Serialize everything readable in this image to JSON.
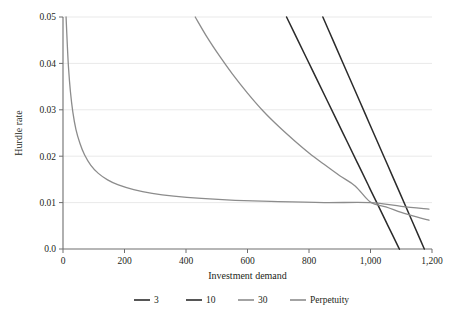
{
  "chart_data": {
    "type": "line",
    "title": "",
    "xlabel": "Investment demand",
    "ylabel": "Hurdle rate",
    "xlim": [
      0,
      1200
    ],
    "ylim": [
      0.0,
      0.05
    ],
    "grid": true,
    "grid_axis": "y",
    "legend_position": "bottom",
    "xticks": [
      0,
      200,
      400,
      600,
      800,
      1000,
      1200
    ],
    "xtick_labels": [
      "0",
      "200",
      "400",
      "600",
      "800",
      "1,000",
      "1,200"
    ],
    "yticks": [
      0.0,
      0.01,
      0.02,
      0.03,
      0.04,
      0.05
    ],
    "ytick_labels": [
      "0.0",
      "0.01",
      "0.02",
      "0.03",
      "0.04",
      "0.05"
    ],
    "series": [
      {
        "name": "3",
        "color": "#2b2b2b",
        "width": 1.5,
        "points": [
          [
            727,
            0.05
          ],
          [
            760,
            0.0455
          ],
          [
            793,
            0.041
          ],
          [
            826,
            0.0365
          ],
          [
            859,
            0.032
          ],
          [
            892,
            0.0275
          ],
          [
            925,
            0.023
          ],
          [
            958,
            0.0185
          ],
          [
            991,
            0.014
          ],
          [
            1000,
            0.01275
          ],
          [
            1024,
            0.0095
          ],
          [
            1057,
            0.005
          ],
          [
            1090,
            0.0005
          ],
          [
            1094,
            0.0
          ]
        ]
      },
      {
        "name": "10",
        "color": "#2b2b2b",
        "width": 1.5,
        "points": [
          [
            845,
            0.05
          ],
          [
            880,
            0.0447
          ],
          [
            915,
            0.0394
          ],
          [
            950,
            0.0341
          ],
          [
            985,
            0.0288
          ],
          [
            1000,
            0.0265
          ],
          [
            1020,
            0.0235
          ],
          [
            1055,
            0.0182
          ],
          [
            1090,
            0.0129
          ],
          [
            1125,
            0.0076
          ],
          [
            1160,
            0.0023
          ],
          [
            1175,
            0.0
          ]
        ]
      },
      {
        "name": "30",
        "color": "#8c8c8c",
        "width": 1.3,
        "points": [
          [
            430,
            0.05
          ],
          [
            470,
            0.0455
          ],
          [
            510,
            0.0415
          ],
          [
            550,
            0.0378
          ],
          [
            600,
            0.0336
          ],
          [
            650,
            0.0298
          ],
          [
            700,
            0.0265
          ],
          [
            750,
            0.0235
          ],
          [
            800,
            0.0207
          ],
          [
            850,
            0.0182
          ],
          [
            900,
            0.0158
          ],
          [
            950,
            0.0136
          ],
          [
            1000,
            0.0101
          ],
          [
            1050,
            0.0091
          ],
          [
            1100,
            0.0079
          ],
          [
            1150,
            0.0069
          ],
          [
            1190,
            0.0062
          ]
        ]
      },
      {
        "name": "Perpetuity",
        "color": "#8c8c8c",
        "width": 1.3,
        "points": [
          [
            10,
            0.05
          ],
          [
            14,
            0.044
          ],
          [
            18,
            0.039
          ],
          [
            24,
            0.034
          ],
          [
            32,
            0.0295
          ],
          [
            42,
            0.0258
          ],
          [
            55,
            0.0228
          ],
          [
            70,
            0.0203
          ],
          [
            90,
            0.0181
          ],
          [
            115,
            0.0163
          ],
          [
            145,
            0.0149
          ],
          [
            180,
            0.0138
          ],
          [
            230,
            0.0128
          ],
          [
            290,
            0.012
          ],
          [
            360,
            0.0114
          ],
          [
            450,
            0.0109
          ],
          [
            560,
            0.0105
          ],
          [
            700,
            0.0102
          ],
          [
            850,
            0.01
          ],
          [
            1000,
            0.01
          ],
          [
            1100,
            0.0092
          ],
          [
            1190,
            0.0086
          ]
        ]
      }
    ],
    "intersection": {
      "x": 1000,
      "y": 0.01
    }
  },
  "legend": {
    "entries": [
      {
        "label": "3",
        "color": "#2b2b2b"
      },
      {
        "label": "10",
        "color": "#2b2b2b"
      },
      {
        "label": "30",
        "color": "#8c8c8c"
      },
      {
        "label": "Perpetuity",
        "color": "#8c8c8c"
      }
    ]
  },
  "style": {
    "axis_color": "#6e6e6e",
    "grid_color": "#e9e9e9",
    "text_color": "#231f20",
    "background": "#ffffff"
  }
}
